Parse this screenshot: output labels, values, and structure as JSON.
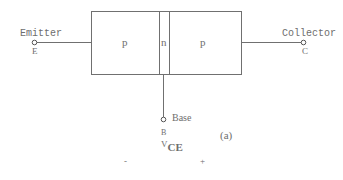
{
  "diagram": {
    "type": "pnp-transistor-structure",
    "regions": [
      {
        "id": "emitter-region",
        "label": "p"
      },
      {
        "id": "base-region",
        "label": "n"
      },
      {
        "id": "collector-region",
        "label": "p"
      }
    ],
    "terminals": {
      "emitter": {
        "name": "Emitter",
        "symbol": "E"
      },
      "collector": {
        "name": "Collector",
        "symbol": "C"
      },
      "base": {
        "name": "Base",
        "symbol": "B"
      }
    },
    "voltage": {
      "label_main": "V",
      "label_sub": "CE",
      "minus": "-",
      "plus": "+"
    },
    "figure_label": "(a)"
  }
}
